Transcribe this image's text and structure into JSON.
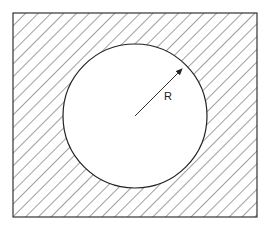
{
  "diagram": {
    "label_radius": "R",
    "colors": {
      "stroke": "#333333",
      "background": "#ffffff"
    }
  }
}
